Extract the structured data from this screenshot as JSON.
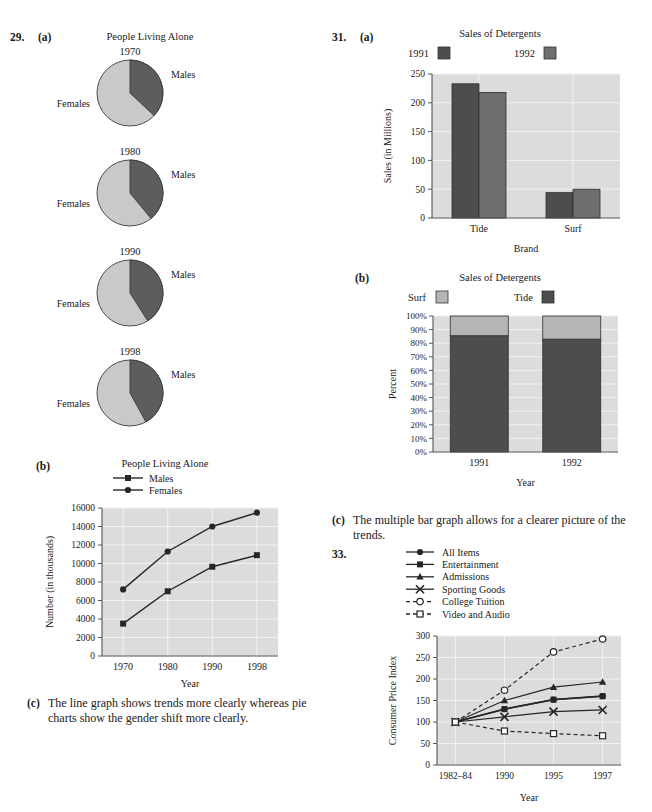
{
  "page": {
    "q29": {
      "number": "29.",
      "part_a": "(a)",
      "part_b": "(b)",
      "part_c": "(c)",
      "answer_c": "The line graph shows trends more clearly whereas pie charts show the gender shift more clearly."
    },
    "q31": {
      "number": "31.",
      "part_a": "(a)",
      "part_b": "(b)",
      "part_c": "(c)",
      "answer_c": "The multiple bar graph allows for a clearer picture of the trends."
    },
    "q33": {
      "number": "33."
    }
  },
  "colors": {
    "males_wedge": "#5d5d5d",
    "females_wedge": "#c9c9c9",
    "bar_1991": "#4d4d4d",
    "bar_1992": "#6e6e6e",
    "tide": "#4d4d4d",
    "surf": "#b5b5b5",
    "plot_bg": "#dcdcdc",
    "grid": "#f2f2f2",
    "axis": "#555555"
  },
  "chart_data": [
    {
      "id": "pies-people-living-alone",
      "type": "pie",
      "title": "People Living Alone",
      "legend": [
        "Males",
        "Females"
      ],
      "slice_labels": {
        "males": "Males",
        "females": "Females"
      },
      "panels": [
        {
          "year": "1970",
          "values": {
            "Males": 37,
            "Females": 63
          }
        },
        {
          "year": "1980",
          "values": {
            "Males": 39,
            "Females": 61
          }
        },
        {
          "year": "1990",
          "values": {
            "Males": 41,
            "Females": 59
          }
        },
        {
          "year": "1998",
          "values": {
            "Males": 42,
            "Females": 58
          }
        }
      ]
    },
    {
      "id": "line-people-living-alone",
      "type": "line",
      "title": "People Living Alone",
      "xlabel": "Year",
      "ylabel": "Number (in thousands)",
      "categories": [
        "1970",
        "1980",
        "1990",
        "1998"
      ],
      "ylim": [
        0,
        16000
      ],
      "yticks": [
        "0",
        "2000",
        "4000",
        "6000",
        "8000",
        "10000",
        "12000",
        "14000",
        "16000"
      ],
      "grid": true,
      "legend_position": "top",
      "series": [
        {
          "name": "Males",
          "marker": "square",
          "values": [
            3500,
            7000,
            9650,
            10900
          ]
        },
        {
          "name": "Females",
          "marker": "circle",
          "values": [
            7200,
            11300,
            14000,
            15500
          ]
        }
      ]
    },
    {
      "id": "bar-sales-of-detergents",
      "type": "bar",
      "title": "Sales of Detergents",
      "xlabel": "Brand",
      "ylabel": "Sales (in Millions)",
      "categories": [
        "Tide",
        "Surf"
      ],
      "ylim": [
        0,
        250
      ],
      "yticks": [
        "0",
        "50",
        "100",
        "150",
        "200",
        "250"
      ],
      "grid": true,
      "legend_position": "top",
      "series": [
        {
          "name": "1991",
          "values": [
            233,
            44
          ]
        },
        {
          "name": "1992",
          "values": [
            218,
            50
          ]
        }
      ]
    },
    {
      "id": "stacked-sales-of-detergents",
      "type": "bar",
      "title": "Sales of Detergents",
      "xlabel": "Year",
      "ylabel": "Percent",
      "categories": [
        "1991",
        "1992"
      ],
      "ylim": [
        0,
        100
      ],
      "yticks": [
        "0%",
        "10%",
        "20%",
        "30%",
        "40%",
        "50%",
        "60%",
        "70%",
        "80%",
        "90%",
        "100%"
      ],
      "grid": true,
      "stacked": true,
      "legend_position": "top",
      "series": [
        {
          "name": "Surf",
          "values": [
            14.5,
            17.0
          ]
        },
        {
          "name": "Tide",
          "values": [
            85.5,
            83.0
          ]
        }
      ]
    },
    {
      "id": "line-consumer-price-index",
      "type": "line",
      "title": "",
      "xlabel": "Year",
      "ylabel": "Consumer Price Index",
      "categories": [
        "1982–84",
        "1990",
        "1995",
        "1997"
      ],
      "ylim": [
        0,
        300
      ],
      "yticks": [
        "0",
        "50",
        "100",
        "150",
        "200",
        "250",
        "300"
      ],
      "grid": true,
      "legend_position": "top",
      "series": [
        {
          "name": "All Items",
          "marker": "circle",
          "style": "solid",
          "values": [
            100,
            130,
            152,
            160
          ]
        },
        {
          "name": "Entertainment",
          "marker": "square",
          "style": "solid",
          "values": [
            100,
            130,
            152,
            160
          ]
        },
        {
          "name": "Admissions",
          "marker": "triangle",
          "style": "solid",
          "values": [
            100,
            150,
            181,
            193
          ]
        },
        {
          "name": "Sporting Goods",
          "marker": "x",
          "style": "solid",
          "values": [
            100,
            112,
            124,
            128
          ]
        },
        {
          "name": "College Tuition",
          "marker": "open-circle",
          "style": "dashed",
          "values": [
            100,
            174,
            263,
            293
          ]
        },
        {
          "name": "Video and Audio",
          "marker": "open-square",
          "style": "dashed",
          "values": [
            100,
            79,
            73,
            68
          ]
        }
      ]
    }
  ]
}
